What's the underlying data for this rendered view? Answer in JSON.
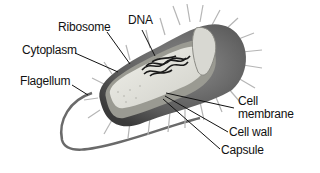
{
  "diagram": {
    "labels": [
      {
        "id": "ribosome",
        "text": "Ribosome"
      },
      {
        "id": "dna",
        "text": "DNA"
      },
      {
        "id": "cytoplasm",
        "text": "Cytoplasm"
      },
      {
        "id": "flagellum",
        "text": "Flagellum"
      },
      {
        "id": "cell_membrane_1",
        "text": "Cell"
      },
      {
        "id": "cell_membrane_2",
        "text": "membrane"
      },
      {
        "id": "cell_wall",
        "text": "Cell wall"
      },
      {
        "id": "capsule",
        "text": "Capsule"
      }
    ]
  }
}
